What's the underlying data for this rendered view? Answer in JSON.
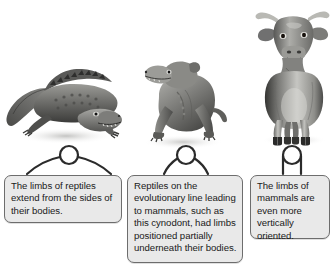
{
  "figure": {
    "background_color": "#ffffff",
    "line_color": "#2b2b2b",
    "box_fill_color": "#e9e9e9",
    "box_border_color": "#6d6d6d",
    "text_color": "#1a1a1a"
  },
  "panels": [
    {
      "id": "reptile",
      "animal_name": "crocodile",
      "animal_alt": "Grayscale illustration of a crocodile with sprawling limbs extending sideways from its body",
      "posture_name": "sprawling-posture-diagram",
      "posture_alt": "Schematic of a round body with limbs splayed outward to the sides",
      "caption": "The limbs of reptiles extend from the sides of their bodies."
    },
    {
      "id": "cynodont",
      "animal_name": "cynodont",
      "animal_alt": "Grayscale illustration of a cynodont, a mammal-like reptile, with limbs partially beneath its body",
      "posture_name": "semi-erect-posture-diagram",
      "posture_alt": "Schematic of a round body with limbs angled partially underneath",
      "caption": "Reptiles on the evolutionary line leading to mammals, such as this cynodont, had limbs positioned partially underneath their bodies."
    },
    {
      "id": "mammal",
      "animal_name": "cow",
      "animal_alt": "Grayscale illustration of a horned cow standing with vertical legs directly beneath its body",
      "posture_name": "erect-posture-diagram",
      "posture_alt": "Schematic of a round body with straight vertical limbs directly underneath",
      "caption": "The limbs of mammals are even more vertically oriented."
    }
  ]
}
